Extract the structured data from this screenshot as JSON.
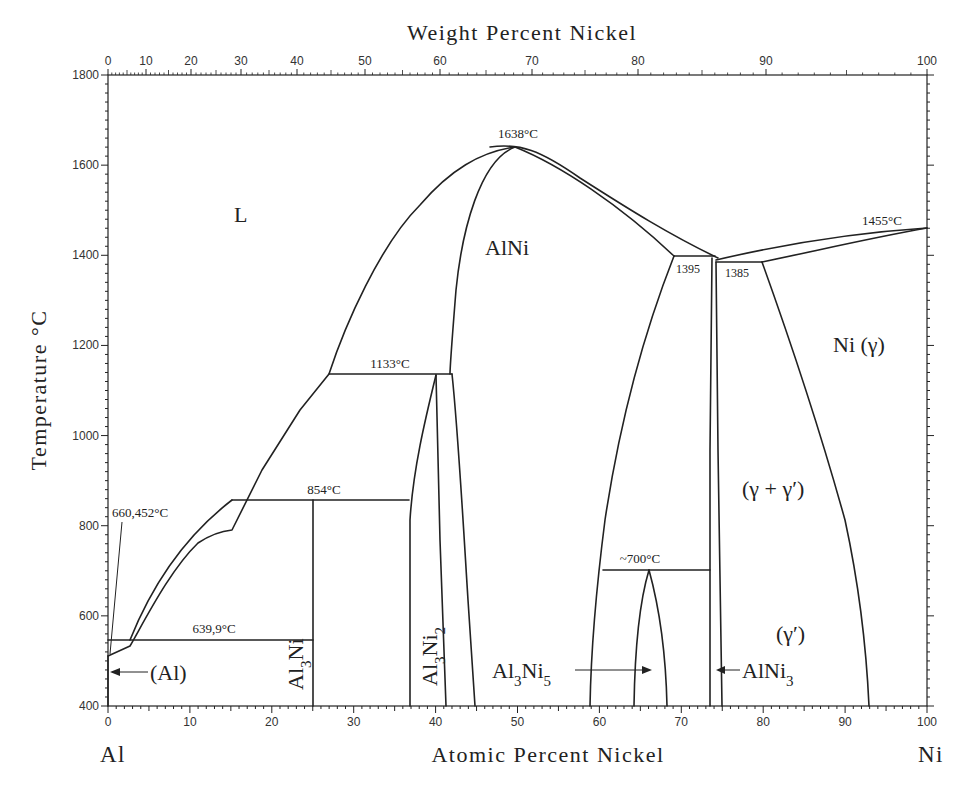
{
  "chart_data": {
    "type": "phase-diagram",
    "xlabel": "Atomic Percent Nickel",
    "x2label": "Weight Percent Nickel",
    "ylabel": "Temperature °C",
    "xlim": [
      0,
      100
    ],
    "ylim": [
      400,
      1800
    ],
    "grid": false,
    "x_ticks": [
      "0",
      "10",
      "20",
      "30",
      "40",
      "50",
      "60",
      "70",
      "80",
      "90",
      "100"
    ],
    "x2_ticks": [
      "0",
      "10",
      "20",
      "30",
      "40",
      "50",
      "60",
      "70",
      "80",
      "90",
      "100"
    ],
    "y_ticks": [
      "400",
      "600",
      "800",
      "1000",
      "1200",
      "1400",
      "1600",
      "1800"
    ],
    "x_end_labels": {
      "left": "Al",
      "right": "Ni"
    },
    "regions": [
      {
        "label": "L",
        "at_pct": 16,
        "temp": 1550
      },
      {
        "label": "AlNi",
        "at_pct": 49,
        "temp": 1420
      },
      {
        "label": "Ni (γ)",
        "at_pct": 91,
        "temp": 1240
      },
      {
        "label": "(γ + γ′)",
        "at_pct": 85,
        "temp": 830
      },
      {
        "label": "(γ′)",
        "at_pct": 83,
        "temp": 550
      },
      {
        "label": "(Al)",
        "at_pct": 6,
        "temp": 470
      },
      {
        "label": "Al3Ni",
        "at_pct": 24,
        "temp": 500,
        "vertical": true
      },
      {
        "label": "Al3Ni2",
        "at_pct": 39,
        "temp": 530,
        "vertical": true
      },
      {
        "label": "Al3Ni5",
        "at_pct": 52,
        "temp": 465
      },
      {
        "label": "AlNi3",
        "at_pct": 80,
        "temp": 465
      }
    ],
    "invariant_points": [
      {
        "label": "660,452°C",
        "at_pct": 0,
        "temp": 660.452,
        "desc": "Al melting point"
      },
      {
        "label": "639,9°C",
        "at_pct": 2.7,
        "temp": 639.9,
        "desc": "eutectic L -> (Al) + Al3Ni"
      },
      {
        "label": "854°C",
        "at_pct": 25,
        "temp": 854,
        "desc": "peritectic L + Al3Ni2 -> Al3Ni"
      },
      {
        "label": "1133°C",
        "at_pct": 40,
        "temp": 1133,
        "desc": "peritectic L + AlNi -> Al3Ni2"
      },
      {
        "label": "1638°C",
        "at_pct": 50,
        "temp": 1638,
        "desc": "congruent melting of AlNi"
      },
      {
        "label": "1395",
        "at_pct": 74,
        "temp": 1395,
        "desc": "peritectic L + AlNi -> AlNi3"
      },
      {
        "label": "1385",
        "at_pct": 75,
        "temp": 1385,
        "desc": "eutectic L -> AlNi3 + Ni(γ)"
      },
      {
        "label": "1455°C",
        "at_pct": 100,
        "temp": 1455,
        "desc": "Ni melting point"
      },
      {
        "label": "~700°C",
        "at_pct": 66,
        "temp": 700,
        "desc": "peritectoid AlNi + AlNi3 -> Al3Ni5"
      }
    ],
    "boundaries": {
      "liquidus_left": [
        [
          0,
          660
        ],
        [
          2.7,
          640
        ],
        [
          7,
          720
        ],
        [
          11,
          800
        ],
        [
          15,
          854
        ],
        [
          21,
          1000
        ],
        [
          26.5,
          1133
        ],
        [
          32,
          1300
        ],
        [
          38,
          1450
        ],
        [
          44,
          1560
        ],
        [
          50,
          1638
        ]
      ],
      "liquidus_right": [
        [
          50,
          1638
        ],
        [
          58,
          1590
        ],
        [
          66,
          1500
        ],
        [
          74,
          1400
        ],
        [
          75,
          1385
        ],
        [
          85,
          1420
        ],
        [
          100,
          1455
        ]
      ],
      "solidus_right": [
        [
          50,
          1638
        ],
        [
          60,
          1560
        ],
        [
          69,
          1440
        ],
        [
          71,
          1395
        ]
      ],
      "AlNi_left": [
        [
          50,
          1638
        ],
        [
          45.5,
          1520
        ],
        [
          42.5,
          1300
        ],
        [
          41.5,
          1133
        ],
        [
          43,
          800
        ],
        [
          44.5,
          400
        ]
      ],
      "AlNi_right": [
        [
          69,
          1395
        ],
        [
          66,
          1150
        ],
        [
          63,
          900
        ],
        [
          61,
          700
        ],
        [
          59,
          400
        ]
      ],
      "Al3Ni2_left": [
        [
          40,
          1133
        ],
        [
          38,
          1000
        ],
        [
          36.8,
          800
        ],
        [
          36.8,
          400
        ]
      ],
      "Al3Ni2_right": [
        [
          40,
          1133
        ],
        [
          40.5,
          800
        ],
        [
          41.2,
          400
        ]
      ],
      "Al3Ni": [
        [
          25,
          854
        ],
        [
          25,
          400
        ]
      ],
      "AlNi3_left": [
        [
          73.8,
          1395
        ],
        [
          73.3,
          700
        ],
        [
          73.3,
          400
        ]
      ],
      "AlNi3_right": [
        [
          74.3,
          1385
        ],
        [
          74.8,
          700
        ],
        [
          75,
          400
        ]
      ],
      "gamma_solvus": [
        [
          80.5,
          1385
        ],
        [
          86,
          1000
        ],
        [
          90,
          700
        ],
        [
          93,
          400
        ]
      ],
      "Al3Ni5_left": [
        [
          66,
          700
        ],
        [
          64.5,
          600
        ],
        [
          64,
          400
        ]
      ],
      "Al3Ni5_right": [
        [
          66,
          700
        ],
        [
          67.5,
          550
        ],
        [
          68,
          400
        ]
      ]
    }
  },
  "labels": {
    "top_title": "Weight Percent Nickel",
    "bottom_title": "Atomic Percent Nickel",
    "y_title": "Temperature °C",
    "left_element": "Al",
    "right_element": "Ni",
    "region_L": "L",
    "region_AlNi": "AlNi",
    "region_Ni": "Ni (γ)",
    "region_gg": "(γ + γ′)",
    "region_gp": "(γ′)",
    "region_Al": "(Al)",
    "t_1638": "1638°C",
    "t_1133": "1133°C",
    "t_854": "854°C",
    "t_660": "660,452°C",
    "t_639": "639,9°C",
    "t_1395": "1395",
    "t_1385": "1385",
    "t_1455": "1455°C",
    "t_700": "~700°C"
  }
}
